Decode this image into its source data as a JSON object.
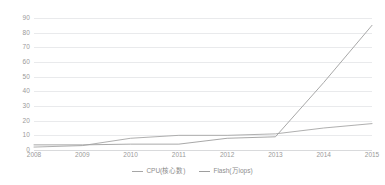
{
  "chart_data": {
    "type": "line",
    "title": "",
    "xlabel": "",
    "ylabel": "",
    "categories": [
      "2008",
      "2009",
      "2010",
      "2011",
      "2012",
      "2013",
      "2014",
      "2015"
    ],
    "x": [
      2008,
      2009,
      2010,
      2011,
      2012,
      2013,
      2014,
      2015
    ],
    "ylim": [
      0,
      90
    ],
    "yticks": [
      "0",
      "10",
      "20",
      "30",
      "40",
      "50",
      "60",
      "70",
      "80",
      "90"
    ],
    "ytick_values": [
      0,
      10,
      20,
      30,
      40,
      50,
      60,
      70,
      80,
      90
    ],
    "grid": true,
    "legend_position": "bottom",
    "series": [
      {
        "name": "CPU(核心数)",
        "color": "#a6a6a6",
        "values": [
          2,
          3,
          8,
          10,
          10,
          11,
          15,
          18
        ]
      },
      {
        "name": "Flash(万iops)",
        "color": "#9e9e9e",
        "values": [
          3.5,
          3.5,
          4,
          4,
          8,
          9,
          46,
          85
        ]
      }
    ]
  },
  "legend": {
    "items": [
      {
        "label": "CPU(核心数)",
        "marker": "line-marker-icon"
      },
      {
        "label": "Flash(万iops)",
        "marker": "line-marker-icon"
      }
    ]
  },
  "colors": {
    "background": "#ffffff",
    "gridline": "#e9eaec",
    "axis_text": "#9a9a9a",
    "series_1": "#a6a6a6",
    "series_2": "#9e9e9e"
  }
}
